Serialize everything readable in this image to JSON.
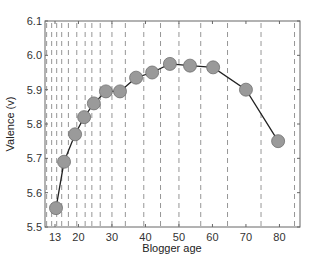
{
  "chart_data": {
    "type": "line",
    "title": "",
    "xlabel": "Blogger age",
    "ylabel": "Valence (v)",
    "xlim": [
      10,
      85.5
    ],
    "ylim": [
      5.5,
      6.1
    ],
    "x_ticks": [
      13,
      20,
      30,
      40,
      50,
      60,
      70,
      80
    ],
    "y_ticks": [
      5.5,
      5.6,
      5.7,
      5.8,
      5.9,
      6.0,
      6.1
    ],
    "grid": "vertical dashed lines at age-bin boundaries",
    "bin_boundaries": [
      10.5,
      12,
      13.5,
      15,
      17,
      19.5,
      22,
      24,
      26.5,
      30,
      34,
      39.5,
      44.5,
      50,
      56.5,
      64.5,
      74.5,
      84.5
    ],
    "legend": null,
    "series": [
      {
        "name": "Valence",
        "marker": "circle",
        "marker_color": "#9a9a9a",
        "line_color": "#222222",
        "x": [
          13.3,
          15.7,
          19.0,
          21.7,
          24.6,
          28.2,
          32.4,
          37.2,
          42.0,
          47.3,
          53.3,
          60.2,
          70.0,
          79.6
        ],
        "y": [
          5.555,
          5.69,
          5.77,
          5.82,
          5.86,
          5.895,
          5.895,
          5.935,
          5.95,
          5.975,
          5.97,
          5.965,
          5.9,
          5.75
        ]
      }
    ]
  },
  "axes": {
    "x_label": "Blogger age",
    "y_label": "Valence (v)",
    "x_tick_labels": [
      "13",
      "20",
      "30",
      "40",
      "50",
      "60",
      "70",
      "80"
    ],
    "y_tick_labels": [
      "5.5",
      "5.6",
      "5.7",
      "5.8",
      "5.9",
      "6.0",
      "6.1"
    ]
  },
  "colors": {
    "marker_fill": "#9a9a9a",
    "marker_stroke": "#6e6e6e",
    "line": "#222222",
    "grid": "#8a8a8a",
    "frame": "#666666"
  }
}
